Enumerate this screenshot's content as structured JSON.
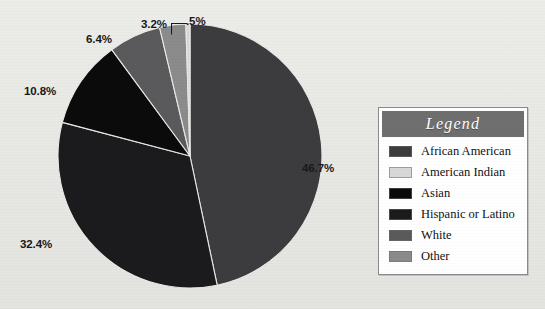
{
  "chart_data": {
    "type": "pie",
    "title": "",
    "legend_title": "Legend",
    "legend_position": "right",
    "start_angle_deg": 0,
    "direction": "clockwise",
    "categories": [
      "African American",
      "American Indian",
      "Asian",
      "Hispanic or Latino",
      "White",
      "Other"
    ],
    "values": [
      46.7,
      0.5,
      10.8,
      32.4,
      6.4,
      3.2
    ],
    "value_labels": [
      "46.7%",
      ".5%",
      "10.8%",
      "32.4%",
      "6.4%",
      "3.2%"
    ],
    "colors": [
      "#3c3c3e",
      "#d8d8d6",
      "#0b0b0c",
      "#1b1b1d",
      "#5a5a5c",
      "#8b8b8c"
    ],
    "draw_order": [
      {
        "name": "African American",
        "value": 46.7,
        "label": "46.7%",
        "color": "#3c3c3e"
      },
      {
        "name": "Hispanic or Latino",
        "value": 32.4,
        "label": "32.4%",
        "color": "#1b1b1d"
      },
      {
        "name": "Asian",
        "value": 10.8,
        "label": "10.8%",
        "color": "#0b0b0c"
      },
      {
        "name": "White",
        "value": 6.4,
        "label": "6.4%",
        "color": "#5a5a5c"
      },
      {
        "name": "Other",
        "value": 3.2,
        "label": "3.2%",
        "color": "#8b8b8c"
      },
      {
        "name": "American Indian",
        "value": 0.5,
        "label": ".5%",
        "color": "#d8d8d6"
      }
    ],
    "units": "percent",
    "total": 100.0
  },
  "labels": {
    "african_american": "46.7%",
    "hispanic_or_latino": "32.4%",
    "asian": "10.8%",
    "white": "6.4%",
    "other": "3.2%",
    "american_indian": ".5%"
  },
  "legend": {
    "title": "Legend",
    "items": [
      {
        "label": "African American",
        "color": "#3c3c3e"
      },
      {
        "label": "American Indian",
        "color": "#d8d8d6"
      },
      {
        "label": "Asian",
        "color": "#0b0b0c"
      },
      {
        "label": "Hispanic or Latino",
        "color": "#1b1b1d"
      },
      {
        "label": "White",
        "color": "#5a5a5c"
      },
      {
        "label": "Other",
        "color": "#8b8b8c"
      }
    ]
  },
  "theme": {
    "background": "#e9e9e7",
    "legend_header_bg": "#6f6f6f",
    "legend_header_text": "#ffffff",
    "legend_body_bg": "#ffffff",
    "legend_border": "#8a8a8a",
    "label_text": "#18181a"
  }
}
